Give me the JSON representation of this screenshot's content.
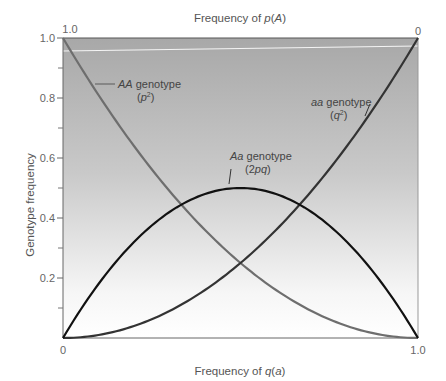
{
  "chart_data": {
    "type": "line",
    "title": "",
    "xlabel": "Frequency of q(a)",
    "xlabel_parts": {
      "prefix": "Frequency of ",
      "var": "q",
      "paren_open": "(",
      "allele": "a",
      "paren_close": ")"
    },
    "x2label": "Frequency of p(A)",
    "x2label_parts": {
      "prefix": "Frequency of ",
      "var": "p",
      "paren_open": "(",
      "allele": "A",
      "paren_close": ")"
    },
    "ylabel": "Genotype frequency",
    "xlim": [
      0,
      1.0
    ],
    "ylim": [
      0,
      1.0
    ],
    "x_ticks": {
      "left": "0",
      "right": "1.0"
    },
    "x2_ticks": {
      "left": "1.0",
      "right": "0"
    },
    "y_ticks": [
      {
        "value": 0.2,
        "label": "0.2"
      },
      {
        "value": 0.4,
        "label": "0.4"
      },
      {
        "value": 0.6,
        "label": "0.6"
      },
      {
        "value": 0.8,
        "label": "0.8"
      },
      {
        "value": 1.0,
        "label": "1.0"
      }
    ],
    "y_minor_ticks": [
      0.1,
      0.3,
      0.5,
      0.7,
      0.9
    ],
    "x": [
      0,
      0.1,
      0.2,
      0.3,
      0.4,
      0.5,
      0.6,
      0.7,
      0.8,
      0.9,
      1.0
    ],
    "series": [
      {
        "name": "AA genotype (p²)",
        "formula": "(1-q)^2",
        "color": "#6e6e6e",
        "values": [
          1.0,
          0.81,
          0.64,
          0.49,
          0.36,
          0.25,
          0.16,
          0.09,
          0.04,
          0.01,
          0.0
        ]
      },
      {
        "name": "aa genotype (q²)",
        "formula": "q^2",
        "color": "#333333",
        "values": [
          0.0,
          0.01,
          0.04,
          0.09,
          0.16,
          0.25,
          0.36,
          0.49,
          0.64,
          0.81,
          1.0
        ]
      },
      {
        "name": "Aa genotype (2pq)",
        "formula": "2q(1-q)",
        "color": "#111111",
        "values": [
          0.0,
          0.18,
          0.32,
          0.42,
          0.48,
          0.5,
          0.48,
          0.42,
          0.32,
          0.18,
          0.0
        ]
      }
    ],
    "annotations": [
      {
        "id": "AA",
        "italic": "AA",
        "text": " genotype",
        "sub_open": "(",
        "sub_var": "p",
        "sup": "2",
        "sub_close": ")"
      },
      {
        "id": "aa",
        "italic": "aa",
        "text": " genotype",
        "sub_open": "(",
        "sub_var": "q",
        "sup": "2",
        "sub_close": ")"
      },
      {
        "id": "Aa",
        "italic": "Aa",
        "text": " genotype",
        "sub_text": "(2",
        "sub_var": "pq",
        "sub_close": ")"
      }
    ],
    "background": {
      "type": "vertical-gradient",
      "top": "#a9a9a9",
      "bottom": "#ffffff"
    },
    "grid": false,
    "legend": "none (inline annotations)"
  }
}
